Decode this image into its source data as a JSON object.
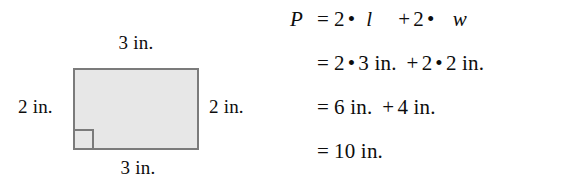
{
  "figure": {
    "background_color": "#ffffff",
    "text_color": "#0d0d0d"
  },
  "diagram": {
    "shape": "rectangle",
    "fill_color": "#e7e7e7",
    "stroke_color": "#7b7b7b",
    "right_angle_marker": true,
    "labels": {
      "top": "3 in.",
      "bottom": "3 in.",
      "left": "2 in.",
      "right": "2 in."
    }
  },
  "equations": {
    "lines": [
      {
        "lhs": "P",
        "relation": "=",
        "terms": [
          "2",
          "•",
          "l",
          "+",
          "2",
          "•",
          "w"
        ],
        "plain": "P = 2 • l + 2 • w"
      },
      {
        "lhs": "",
        "relation": "=",
        "terms": [
          "2",
          "•",
          "3 in.",
          "+",
          "2",
          "•",
          "2 in."
        ],
        "plain": "= 2 • 3 in. + 2 • 2 in."
      },
      {
        "lhs": "",
        "relation": "=",
        "terms": [
          "6 in.",
          "+",
          "4 in."
        ],
        "plain": "= 6 in. + 4 in."
      },
      {
        "lhs": "",
        "relation": "=",
        "terms": [
          "10 in."
        ],
        "plain": "= 10 in."
      }
    ],
    "tokens": {
      "P": "P",
      "eq": "=",
      "two": "2",
      "three": "3",
      "four": "4",
      "six": "6",
      "ten": "10",
      "dot": "•",
      "plus": "+",
      "var_l": "l",
      "var_w": "w",
      "unit": "in.",
      "three_in": "3 in.",
      "two_in": "2 in.",
      "six_in": "6 in.",
      "four_in": "4 in.",
      "ten_in": "10 in."
    }
  }
}
